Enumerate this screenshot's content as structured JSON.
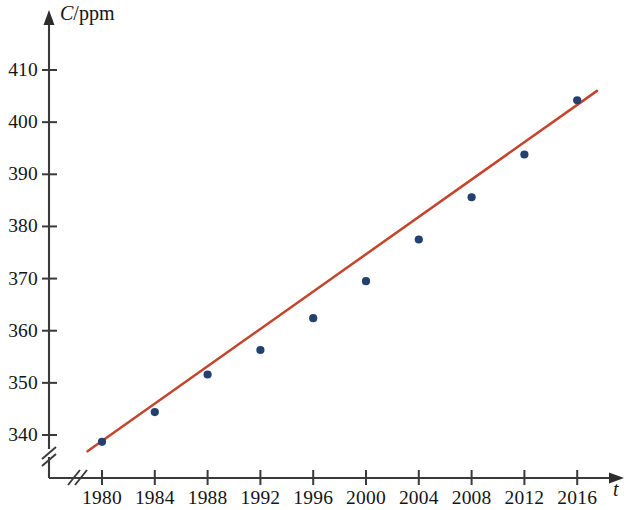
{
  "chart_data": {
    "type": "scatter",
    "title": "",
    "subtitle": "",
    "xlabel": "t",
    "ylabel": "C/ppm",
    "ylabel_parts": {
      "variable": "C",
      "unit": "/ppm"
    },
    "x": [
      1980,
      1984,
      1988,
      1992,
      1996,
      2000,
      2004,
      2008,
      2012,
      2016
    ],
    "values": [
      338.7,
      344.4,
      351.6,
      356.3,
      362.4,
      369.5,
      377.5,
      385.6,
      393.8,
      404.2
    ],
    "series": [
      {
        "name": "CO2 concentration",
        "type": "scatter",
        "color": "#23406e",
        "values": [
          338.7,
          344.4,
          351.6,
          356.3,
          362.4,
          369.5,
          377.5,
          385.6,
          393.8,
          404.2
        ]
      },
      {
        "name": "regression line",
        "type": "line",
        "color": "#c4452c",
        "endpoints": [
          [
            1978.9,
            336.9
          ],
          [
            2017.5,
            406.0
          ]
        ],
        "slope_per_year": 1.79,
        "values": [
          338.6,
          345.8,
          353.0,
          360.1,
          367.3,
          374.5,
          381.6,
          388.8,
          396.0,
          403.1
        ]
      }
    ],
    "xlim": [
      1978,
      2018
    ],
    "ylim": [
      336,
      414
    ],
    "x_ticks": [
      1980,
      1984,
      1988,
      1992,
      1996,
      2000,
      2004,
      2008,
      2012,
      2016
    ],
    "x_tick_labels": [
      "1980",
      "1984",
      "1988",
      "1992",
      "1996",
      "2000",
      "2004",
      "2008",
      "2012",
      "2016"
    ],
    "y_ticks": [
      340,
      350,
      360,
      370,
      380,
      390,
      400,
      410
    ],
    "y_tick_labels": [
      "340",
      "350",
      "360",
      "370",
      "380",
      "390",
      "400",
      "410"
    ],
    "grid": false,
    "legend": "none",
    "axis_break_x": true,
    "axis_break_y": true,
    "colors": {
      "point": "#23406e",
      "line": "#c4452c",
      "axis": "#3a3a3a",
      "text": "#141414",
      "background": "#ffffff"
    }
  }
}
